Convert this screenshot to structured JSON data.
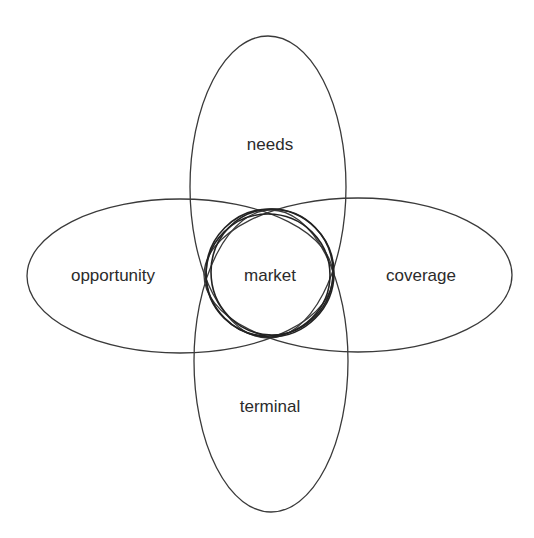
{
  "diagram": {
    "type": "venn-flower",
    "center": {
      "label": "market"
    },
    "petals": [
      {
        "id": "top",
        "label": "needs"
      },
      {
        "id": "left",
        "label": "opportunity"
      },
      {
        "id": "right",
        "label": "coverage"
      },
      {
        "id": "bottom",
        "label": "terminal"
      }
    ],
    "colors": {
      "stroke": "#3a3a3a",
      "text": "#2b2b2b",
      "background": "#ffffff"
    }
  }
}
